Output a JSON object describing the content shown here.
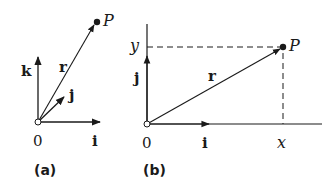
{
  "panels": [
    {
      "caption": "(a)",
      "origin_label": "0",
      "vectors": {
        "r": "r",
        "i": "i",
        "j": "j",
        "k": "k"
      },
      "point_label": "P"
    },
    {
      "caption": "(b)",
      "origin_label": "0",
      "vectors": {
        "r": "r",
        "i": "i",
        "j": "j"
      },
      "point_label": "P",
      "x_label": "x",
      "y_label": "y"
    }
  ],
  "colors": {
    "ink": "#1a1a1a",
    "background": "#ffffff"
  }
}
